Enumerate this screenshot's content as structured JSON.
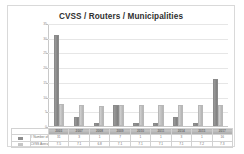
{
  "chart_data": {
    "type": "bar",
    "title": "CVSS / Routers / Municipalities",
    "xlabel": "",
    "ylabel": "",
    "ylim": [
      0,
      35
    ],
    "yticks": [
      0,
      5,
      10,
      15,
      20,
      25,
      30,
      35
    ],
    "grid": true,
    "legend_position": "table",
    "categories": [
      "2003",
      "2007",
      "2008",
      "2009",
      "2010",
      "2011",
      "2014",
      "2015",
      "2017"
    ],
    "series": [
      {
        "name": "# Number of Municipalities",
        "values": [
          31,
          3,
          1,
          7,
          1,
          1,
          3,
          1,
          16
        ]
      },
      {
        "name": "CVSS Average",
        "values": [
          7.5,
          7.1,
          6.8,
          7.1,
          7.1,
          7.1,
          7.1,
          7.2,
          7.3
        ]
      }
    ],
    "series_colors": [
      "#8e8e8e",
      "#c6c6c6"
    ]
  },
  "chart": {
    "title": "CVSS / Routers / Municipalities"
  },
  "table": {
    "rows": [
      {
        "label": "# Number of Municipalities",
        "swatch": "sw-count",
        "values": [
          "31",
          "3",
          "1",
          "7",
          "1",
          "1",
          "3",
          "1",
          "16"
        ]
      },
      {
        "label": "CVSS Average",
        "swatch": "sw-avg",
        "values": [
          "7.5",
          "7.1",
          "6.8",
          "7.1",
          "7.1",
          "7.1",
          "7.1",
          "7.2",
          "7.3"
        ]
      }
    ]
  }
}
